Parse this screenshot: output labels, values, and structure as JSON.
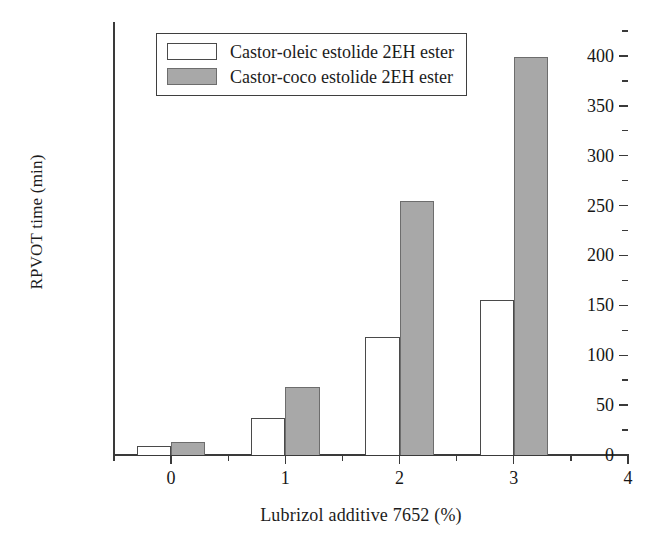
{
  "chart_data": {
    "type": "bar",
    "title": "",
    "xlabel": "Lubrizol additive 7652 (%)",
    "ylabel": "RPVOT time (min)",
    "categories": [
      "0",
      "1",
      "2",
      "3"
    ],
    "x": [
      0,
      1,
      2,
      3
    ],
    "series": [
      {
        "name": "Castor-oleic estolide 2EH ester",
        "values": [
          9,
          37,
          118,
          155
        ],
        "fill": "#ffffff",
        "edge": "#4a4a4a"
      },
      {
        "name": "Castor-coco estolide 2EH ester",
        "values": [
          13,
          68,
          255,
          399
        ],
        "fill": "#a8a8a8",
        "edge": "#6d6d6d"
      }
    ],
    "xlim": [
      -0.5,
      4.0
    ],
    "ylim": [
      0,
      434
    ],
    "ytick_major": [
      0,
      50,
      100,
      150,
      200,
      250,
      300,
      350,
      400
    ],
    "ytick_minor": [
      25,
      75,
      125,
      175,
      225,
      275,
      325,
      375,
      425
    ],
    "xtick_major": [
      0,
      1,
      2,
      3,
      4
    ],
    "xtick_minor": [
      -0.5,
      0.5,
      1.5,
      2.5,
      3.5
    ],
    "xtick_labels": [
      "0",
      "1",
      "2",
      "3",
      "4"
    ],
    "grid": false,
    "legend_position": "upper-left-inside"
  },
  "legend": {
    "entries": [
      {
        "label": "Castor-oleic estolide 2EH ester",
        "swatch": "open"
      },
      {
        "label": "Castor-coco estolide 2EH ester",
        "swatch": "filled"
      }
    ]
  },
  "axes": {
    "y_title": "RPVOT time (min)",
    "x_title": "Lubrizol additive 7652 (%)",
    "y_labels": [
      "0",
      "50",
      "100",
      "150",
      "200",
      "250",
      "300",
      "350",
      "400"
    ],
    "x_labels": [
      "0",
      "1",
      "2",
      "3",
      "4"
    ]
  }
}
